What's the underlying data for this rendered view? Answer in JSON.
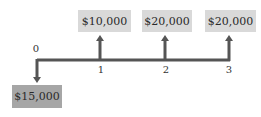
{
  "diagram": {
    "type": "cash-flow-timeline",
    "axis_color": "#555555",
    "periods": [
      "0",
      "1",
      "2",
      "3"
    ],
    "outflows": [
      {
        "period": "0",
        "amount": "$15,000",
        "color": "#a6a6a6"
      }
    ],
    "inflows": [
      {
        "period": "1",
        "amount": "$10,000",
        "color": "#d9d9d9"
      },
      {
        "period": "2",
        "amount": "$20,000",
        "color": "#d9d9d9"
      },
      {
        "period": "3",
        "amount": "$20,000",
        "color": "#d9d9d9"
      }
    ]
  }
}
